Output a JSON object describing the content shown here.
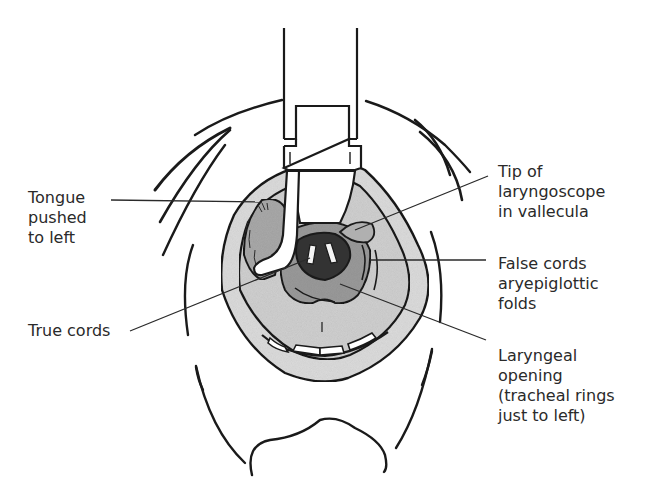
{
  "diagram": {
    "labels": {
      "tongue": [
        "Tongue",
        "pushed",
        "to left"
      ],
      "true_cords": [
        "True cords"
      ],
      "tip": [
        "Tip of",
        "laryngoscope",
        "in vallecula"
      ],
      "false_cords": [
        "False cords",
        "aryepiglottic",
        "folds"
      ],
      "laryngeal_opening": [
        "Laryngeal",
        "opening",
        "(tracheal rings",
        "just to left)"
      ]
    },
    "colors": {
      "line": "#1a1a1a",
      "mouth_fill": "#d9d9d9",
      "tongue_fill": "#a8a8a8",
      "larynx_dark": "#3a3a3a",
      "background": "#ffffff"
    }
  }
}
